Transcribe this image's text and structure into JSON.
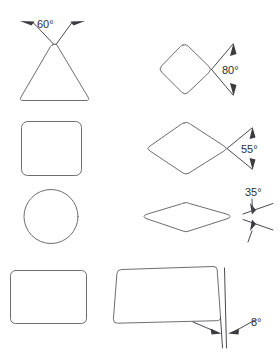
{
  "figure": {
    "background_color": "#ffffff",
    "line_color": "#6e6e72",
    "annotation_color": "#3c3c40",
    "text_color": "#2e2e32"
  },
  "shapes": [
    {
      "id": "triangle",
      "name": "rounded-triangle",
      "row": 1,
      "column": "left",
      "description": "Equilateral triangle with rounded corners",
      "annotation": null
    },
    {
      "id": "diamond-80",
      "name": "rounded-diamond",
      "row": 1,
      "column": "right",
      "description": "Rotated square (diamond) with rounded corners",
      "annotation": "ang-80"
    },
    {
      "id": "square",
      "name": "rounded-square",
      "row": 2,
      "column": "left",
      "description": "Square with rounded corners",
      "annotation": null
    },
    {
      "id": "rhombus-55",
      "name": "rounded-rhombus-wide",
      "row": 2,
      "column": "right",
      "description": "Wide rhombus with rounded corners",
      "annotation": "ang-55"
    },
    {
      "id": "circle",
      "name": "circle",
      "row": 3,
      "column": "left",
      "description": "Circle",
      "annotation": null
    },
    {
      "id": "rhombus-35",
      "name": "rounded-rhombus-flat",
      "row": 3,
      "column": "right",
      "description": "Flat rhombus with rounded corners",
      "annotation": "ang-35"
    },
    {
      "id": "rectangle",
      "name": "rounded-rectangle",
      "row": 4,
      "column": "left",
      "description": "Wide rectangle with rounded corners",
      "annotation": null
    },
    {
      "id": "rectangle-tilted",
      "name": "rounded-rectangle-tilted",
      "row": 4,
      "column": "right",
      "description": "Wide rectangle with rounded corners, tilted slightly",
      "annotation": "ang-8"
    }
  ],
  "annotations": {
    "ang_60": {
      "value": "60",
      "label": "60°",
      "target_shape": "triangle",
      "position": "above-apex"
    },
    "ang_80": {
      "value": "80",
      "label": "80°",
      "target_shape": "diamond-80",
      "position": "right-vertex"
    },
    "ang_55": {
      "value": "55",
      "label": "55°",
      "target_shape": "rhombus-55",
      "position": "right-vertex"
    },
    "ang_35": {
      "value": "35",
      "label": "35°",
      "target_shape": "rhombus-35",
      "position": "right-of-shape"
    },
    "ang_8": {
      "value": "8",
      "label": "8°",
      "target_shape": "rectangle-tilted",
      "position": "below-right-edge"
    }
  }
}
